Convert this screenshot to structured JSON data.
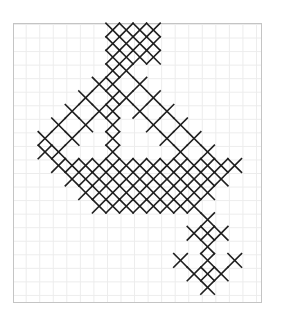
{
  "pattern": {
    "type": "cross-stitch chart",
    "colors": {
      "background": "#ffffff",
      "grid_line": "#ececec",
      "border": "#c4c4c4",
      "stitch": "#1e1e1e"
    },
    "grid": {
      "origin_x": 45,
      "origin_y": 30,
      "cell_size": 13.55
    },
    "stitches": [
      [
        5,
        0
      ],
      [
        6,
        0
      ],
      [
        7,
        0
      ],
      [
        8,
        0
      ],
      [
        5,
        1
      ],
      [
        6,
        1
      ],
      [
        7,
        1
      ],
      [
        8,
        1
      ],
      [
        5,
        2
      ],
      [
        6,
        2
      ],
      [
        7,
        2
      ],
      [
        8,
        2
      ],
      [
        5,
        3
      ],
      [
        6,
        3
      ],
      [
        4,
        4
      ],
      [
        5,
        4
      ],
      [
        7,
        4
      ],
      [
        3,
        5
      ],
      [
        5,
        5
      ],
      [
        6,
        5
      ],
      [
        8,
        5
      ],
      [
        2,
        6
      ],
      [
        4,
        6
      ],
      [
        5,
        6
      ],
      [
        7,
        6
      ],
      [
        9,
        6
      ],
      [
        1,
        7
      ],
      [
        3,
        7
      ],
      [
        5,
        7
      ],
      [
        8,
        7
      ],
      [
        10,
        7
      ],
      [
        0,
        8
      ],
      [
        2,
        8
      ],
      [
        5,
        8
      ],
      [
        9,
        8
      ],
      [
        11,
        8
      ],
      [
        0,
        9
      ],
      [
        1,
        9
      ],
      [
        5,
        9
      ],
      [
        10,
        9
      ],
      [
        12,
        9
      ],
      [
        1,
        10
      ],
      [
        2,
        10
      ],
      [
        3,
        10
      ],
      [
        4,
        10
      ],
      [
        5,
        10
      ],
      [
        6,
        10
      ],
      [
        7,
        10
      ],
      [
        8,
        10
      ],
      [
        9,
        10
      ],
      [
        10,
        10
      ],
      [
        11,
        10
      ],
      [
        12,
        10
      ],
      [
        13,
        10
      ],
      [
        14,
        10
      ],
      [
        2,
        11
      ],
      [
        3,
        11
      ],
      [
        4,
        11
      ],
      [
        5,
        11
      ],
      [
        6,
        11
      ],
      [
        7,
        11
      ],
      [
        8,
        11
      ],
      [
        9,
        11
      ],
      [
        10,
        11
      ],
      [
        11,
        11
      ],
      [
        12,
        11
      ],
      [
        13,
        11
      ],
      [
        3,
        12
      ],
      [
        4,
        12
      ],
      [
        5,
        12
      ],
      [
        6,
        12
      ],
      [
        7,
        12
      ],
      [
        8,
        12
      ],
      [
        9,
        12
      ],
      [
        10,
        12
      ],
      [
        11,
        12
      ],
      [
        12,
        12
      ],
      [
        4,
        13
      ],
      [
        5,
        13
      ],
      [
        6,
        13
      ],
      [
        7,
        13
      ],
      [
        8,
        13
      ],
      [
        9,
        13
      ],
      [
        10,
        13
      ],
      [
        11,
        13
      ],
      [
        12,
        14
      ],
      [
        11,
        15
      ],
      [
        12,
        15
      ],
      [
        13,
        15
      ],
      [
        12,
        16
      ],
      [
        10,
        17
      ],
      [
        12,
        17
      ],
      [
        14,
        17
      ],
      [
        11,
        18
      ],
      [
        12,
        18
      ],
      [
        13,
        18
      ],
      [
        12,
        19
      ]
    ]
  }
}
